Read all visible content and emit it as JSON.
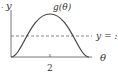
{
  "diagram": {
    "y_axis_label": "y",
    "x_axis_label": "θ",
    "curve_label": "g(θ)",
    "dashed_line_label": "y = :",
    "x_tick_label": "2",
    "leading_mark": ".",
    "colors": {
      "axis": "#555555",
      "curve": "#444444",
      "dashed": "#666666",
      "text": "#333333"
    }
  }
}
